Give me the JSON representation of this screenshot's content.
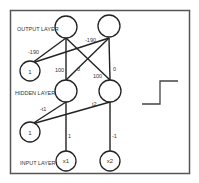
{
  "diagram": {
    "layers": {
      "output": "OUTPUT LAYER",
      "hidden": "HIDDEN LAYER",
      "input": "INPUT LAYER"
    },
    "nodes": {
      "out1": "",
      "out2": "",
      "bias_out": "1",
      "hid1": "",
      "hid2": "",
      "bias_hid": "1",
      "in1": "x1",
      "in2": "x2"
    },
    "weights": {
      "bias_out_to_out1": "-190",
      "bias_out_to_out2": "-190",
      "hid1_to_out1": "100",
      "hid1_to_out2": "0",
      "hid2_to_out1": "100",
      "hid2_to_out2": "0",
      "bias_hid_to_hid1": "-t1",
      "bias_hid_to_hid2": "t2",
      "in1_to_hid1": "1",
      "in2_to_hid2": "-1"
    },
    "side_figure": "step-function"
  }
}
